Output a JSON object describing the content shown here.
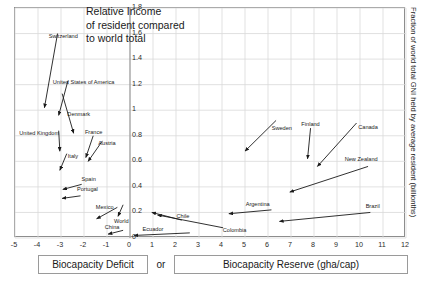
{
  "chart_data": {
    "type": "scatter",
    "title": "Relative Income\nof resident compared\nto world total",
    "xlabel_left": "Biocapacity Deficit",
    "xlabel_conjunction": "or",
    "xlabel_right": "Biocapacity Reserve (gha/cap)",
    "ylabel_right": "Fraction of world total GNI held by average resident (billionths)",
    "xlim": [
      -5,
      12
    ],
    "ylim": [
      0,
      1.8
    ],
    "xticks": [
      -5,
      -4,
      -3,
      -2,
      -1,
      0,
      1,
      2,
      3,
      4,
      5,
      6,
      7,
      8,
      9,
      10,
      11,
      12
    ],
    "yticks": [
      0,
      0.2,
      0.4,
      0.6,
      0.8,
      1,
      1.2,
      1.4,
      1.6,
      1.8
    ],
    "xtick_labels": [
      "-5",
      "-4",
      "-3",
      "-2",
      "-1",
      "0",
      "1",
      "2",
      "3",
      "4",
      "5",
      "6",
      "7",
      "8",
      "9",
      "10",
      "11",
      "12"
    ],
    "ytick_labels": [
      "0",
      "0.2",
      "0.4",
      "0.6",
      "0.8",
      "1",
      "1.2",
      "1.4",
      "1.6",
      "1.8"
    ],
    "grid": true,
    "grid_x_step": 1,
    "grid_y_step": 0.2,
    "grid_color": "#d9d9d9",
    "arrow_color": "#1a1a1a",
    "legend": "none",
    "points": [
      {
        "name": "Switzerland",
        "tail_x": -3.15,
        "tail_y": 1.6,
        "head_x": -3.72,
        "head_y": 1.02,
        "label_x": -2.9,
        "label_y": 1.58
      },
      {
        "name": "United States of America",
        "tail_x": -2.7,
        "tail_y": 1.23,
        "head_x": -3.1,
        "head_y": 0.96,
        "label_x": -2.02,
        "label_y": 1.22
      },
      {
        "name": "Denmark",
        "tail_x": -2.95,
        "tail_y": 1.13,
        "head_x": -2.45,
        "head_y": 0.82,
        "label_x": -2.23,
        "label_y": 0.97
      },
      {
        "name": "United Kingdom",
        "tail_x": -3.1,
        "tail_y": 0.84,
        "head_x": -3.05,
        "head_y": 0.68,
        "label_x": -3.95,
        "label_y": 0.82
      },
      {
        "name": "France",
        "tail_x": -1.6,
        "tail_y": 0.8,
        "head_x": -1.92,
        "head_y": 0.63,
        "label_x": -1.58,
        "label_y": 0.83
      },
      {
        "name": "Austria",
        "tail_x": -1.2,
        "tail_y": 0.76,
        "head_x": -1.82,
        "head_y": 0.6,
        "label_x": -1.0,
        "label_y": 0.74
      },
      {
        "name": "Italy",
        "tail_x": -2.75,
        "tail_y": 0.66,
        "head_x": -3.05,
        "head_y": 0.53,
        "label_x": -2.48,
        "label_y": 0.64
      },
      {
        "name": "Spain",
        "tail_x": -2.1,
        "tail_y": 0.42,
        "head_x": -2.92,
        "head_y": 0.38,
        "label_x": -1.8,
        "label_y": 0.46
      },
      {
        "name": "Portugal",
        "tail_x": -2.15,
        "tail_y": 0.33,
        "head_x": -2.95,
        "head_y": 0.31,
        "label_x": -1.85,
        "label_y": 0.38
      },
      {
        "name": "Mexico",
        "tail_x": -0.55,
        "tail_y": 0.24,
        "head_x": -1.45,
        "head_y": 0.15,
        "label_x": -1.1,
        "label_y": 0.24
      },
      {
        "name": "World",
        "tail_x": -0.3,
        "tail_y": 0.26,
        "head_x": -0.52,
        "head_y": 0.17,
        "label_x": -0.38,
        "label_y": 0.13
      },
      {
        "name": "China",
        "tail_x": -0.3,
        "tail_y": 0.06,
        "head_x": -0.95,
        "head_y": 0.03,
        "label_x": -0.78,
        "label_y": 0.09
      },
      {
        "name": "Ecuador",
        "tail_x": 2.6,
        "tail_y": 0.04,
        "head_x": 0.18,
        "head_y": 0.02,
        "label_x": 1.0,
        "label_y": 0.07
      },
      {
        "name": "Chile",
        "tail_x": 2.25,
        "tail_y": 0.14,
        "head_x": 0.95,
        "head_y": 0.2,
        "label_x": 2.3,
        "label_y": 0.17
      },
      {
        "name": "Colombia",
        "tail_x": 4.05,
        "tail_y": 0.08,
        "head_x": 1.2,
        "head_y": 0.18,
        "label_x": 4.55,
        "label_y": 0.06
      },
      {
        "name": "Argentina",
        "tail_x": 6.15,
        "tail_y": 0.22,
        "head_x": 4.3,
        "head_y": 0.19,
        "label_x": 5.55,
        "label_y": 0.27
      },
      {
        "name": "Sweden",
        "tail_x": 6.35,
        "tail_y": 0.92,
        "head_x": 5.0,
        "head_y": 0.68,
        "label_x": 6.6,
        "label_y": 0.86
      },
      {
        "name": "Finland",
        "tail_x": 7.85,
        "tail_y": 0.86,
        "head_x": 7.72,
        "head_y": 0.62,
        "label_x": 7.85,
        "label_y": 0.89
      },
      {
        "name": "Canada",
        "tail_x": 9.85,
        "tail_y": 0.9,
        "head_x": 8.15,
        "head_y": 0.56,
        "label_x": 10.35,
        "label_y": 0.87
      },
      {
        "name": "New Zealand",
        "tail_x": 10.35,
        "tail_y": 0.56,
        "head_x": 6.95,
        "head_y": 0.36,
        "label_x": 10.05,
        "label_y": 0.62
      },
      {
        "name": "Brazil",
        "tail_x": 10.45,
        "tail_y": 0.2,
        "head_x": 6.5,
        "head_y": 0.13,
        "label_x": 10.55,
        "label_y": 0.25
      }
    ]
  }
}
